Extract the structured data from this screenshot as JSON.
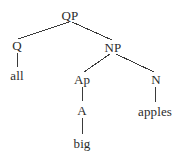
{
  "figure": {
    "kind": "syntax-tree-diagram",
    "background_color": "#ffffff",
    "text_color": "#2b2b2b",
    "line_color": "#3a3a3a",
    "width": 179,
    "height": 157
  },
  "nodes": [
    {
      "id": "qp",
      "label": "QP",
      "type": "nonterminal",
      "x": 70,
      "y": 15
    },
    {
      "id": "q",
      "label": "Q",
      "type": "nonterminal",
      "x": 17,
      "y": 45
    },
    {
      "id": "all",
      "label": "all",
      "type": "terminal",
      "x": 17,
      "y": 75
    },
    {
      "id": "np",
      "label": "NP",
      "type": "nonterminal",
      "x": 113,
      "y": 47
    },
    {
      "id": "ap",
      "label": "Ap",
      "type": "nonterminal",
      "x": 82,
      "y": 79
    },
    {
      "id": "a",
      "label": "A",
      "type": "nonterminal",
      "x": 82,
      "y": 110
    },
    {
      "id": "big",
      "label": "big",
      "type": "terminal",
      "x": 82,
      "y": 143
    },
    {
      "id": "n",
      "label": "N",
      "type": "nonterminal",
      "x": 156,
      "y": 79
    },
    {
      "id": "apples",
      "label": "apples",
      "type": "terminal",
      "x": 155,
      "y": 111
    }
  ],
  "edges": [
    {
      "from": "qp",
      "to": "q",
      "x1": 69,
      "y1": 22,
      "x2": 18,
      "y2": 39
    },
    {
      "from": "qp",
      "to": "np",
      "x1": 72,
      "y1": 22,
      "x2": 112,
      "y2": 40
    },
    {
      "from": "q",
      "to": "all",
      "x1": 17,
      "y1": 53,
      "x2": 17,
      "y2": 67
    },
    {
      "from": "np",
      "to": "ap",
      "x1": 110,
      "y1": 54,
      "x2": 84,
      "y2": 72
    },
    {
      "from": "np",
      "to": "n",
      "x1": 116,
      "y1": 54,
      "x2": 154,
      "y2": 72
    },
    {
      "from": "ap",
      "to": "a",
      "x1": 82,
      "y1": 87,
      "x2": 82,
      "y2": 101
    },
    {
      "from": "a",
      "to": "big",
      "x1": 82,
      "y1": 118,
      "x2": 82,
      "y2": 134
    },
    {
      "from": "n",
      "to": "apples",
      "x1": 155,
      "y1": 87,
      "x2": 155,
      "y2": 102
    }
  ]
}
